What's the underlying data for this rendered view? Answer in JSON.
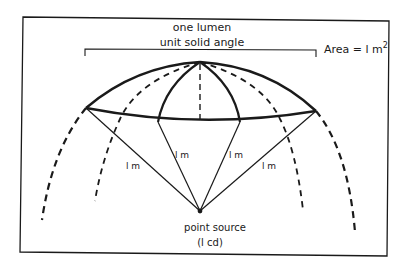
{
  "diagram": {
    "type": "photometry-illustration",
    "labels": {
      "title_line1": "one lumen",
      "title_line2": "unit solid angle",
      "area_prefix": "Area = l m",
      "area_superscript": "2",
      "radius_1": "l m",
      "radius_2": "l m",
      "radius_3": "l m",
      "radius_4": "l m",
      "source_line1": "point source",
      "source_line2": "(l cd)"
    },
    "colors": {
      "ink": "#1a1a1a",
      "background": "#ffffff"
    }
  }
}
